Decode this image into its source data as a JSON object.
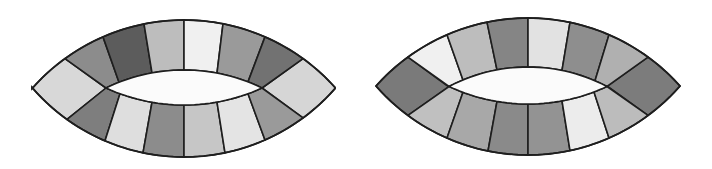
{
  "figure": {
    "background": "#ffffff",
    "stroke_color": "#1e1e1e"
  },
  "shapes": [
    {
      "name": "lens-left",
      "left_tip": [
        32,
        88
      ],
      "right_tip": [
        335,
        88
      ],
      "center_x": 184,
      "outer_top_y": 20,
      "outer_bottom_y": 157,
      "inner_left": [
        106,
        88
      ],
      "inner_right": [
        262,
        88
      ],
      "inner_top_y": 70,
      "inner_bottom_y": 105,
      "top_dividers_outer_x": [
        65,
        103,
        144,
        184,
        223,
        265,
        303
      ],
      "top_dividers_inner_x": [
        106,
        119,
        152,
        184,
        217,
        248,
        262
      ],
      "bottom_dividers_outer_x": [
        67,
        105,
        143,
        184,
        225,
        265,
        303
      ],
      "bottom_dividers_inner_x": [
        106,
        120,
        152,
        184,
        217,
        248,
        262
      ],
      "left_tip_color": "#d8d8d8",
      "right_tip_color": "#d6d6d6",
      "top_colors": [
        "#8c8c8c",
        "#5c5c5c",
        "#bdbdbd",
        "#f0f0f0",
        "#9a9a9a",
        "#727272"
      ],
      "bottom_colors": [
        "#7e7e7e",
        "#dedede",
        "#8c8c8c",
        "#c6c6c6",
        "#e4e4e4",
        "#9a9a9a"
      ]
    },
    {
      "name": "lens-right",
      "left_tip": [
        376,
        87
      ],
      "right_tip": [
        680,
        85
      ],
      "center_x": 528,
      "outer_top_y": 18,
      "outer_bottom_y": 155,
      "inner_left": [
        449,
        87
      ],
      "inner_right": [
        607,
        86
      ],
      "inner_top_y": 67,
      "inner_bottom_y": 104,
      "top_dividers_outer_x": [
        408,
        447,
        487,
        528,
        570,
        609,
        648
      ],
      "top_dividers_inner_x": [
        449,
        463,
        497,
        528,
        562,
        595,
        607
      ],
      "bottom_dividers_outer_x": [
        408,
        447,
        488,
        528,
        570,
        609,
        648
      ],
      "bottom_dividers_inner_x": [
        449,
        463,
        497,
        528,
        562,
        594,
        607
      ],
      "left_tip_color": "#7a7a7a",
      "right_tip_color": "#7c7c7c",
      "top_colors": [
        "#f0f0f0",
        "#bdbdbd",
        "#858585",
        "#e2e2e2",
        "#8e8e8e",
        "#b0b0b0"
      ],
      "bottom_colors": [
        "#c0c0c0",
        "#a8a8a8",
        "#8a8a8a",
        "#939393",
        "#ececec",
        "#bcbcbc"
      ]
    }
  ]
}
